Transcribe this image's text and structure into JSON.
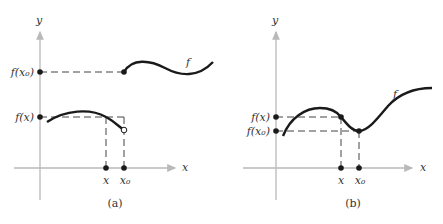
{
  "colors": {
    "axis": "#b9b9b9",
    "curve": "#1a1a1a",
    "dash": "#444444",
    "text": "#333333"
  },
  "panels": [
    {
      "caption": "(a)",
      "y_axis_label": "y",
      "x_axis_label": "x",
      "function_label": "f",
      "y_tick_labels": [
        "f(x₀)",
        "f(x)"
      ],
      "x_tick_labels": [
        "x",
        "x₀"
      ],
      "points": {
        "f_x0_filled": "closed dot at (x₀, f(x₀))",
        "f_x_open_end": "open dot at end of left branch above x₀"
      },
      "description": "Jump discontinuity at x₀: left branch ends in open circle, right branch starts with closed dot at f(x₀)"
    },
    {
      "caption": "(b)",
      "y_axis_label": "y",
      "x_axis_label": "x",
      "function_label": "f",
      "y_tick_labels": [
        "f(x)",
        "f(x₀)"
      ],
      "x_tick_labels": [
        "x",
        "x₀"
      ],
      "description": "Continuous function with local minimum at x₀"
    }
  ]
}
